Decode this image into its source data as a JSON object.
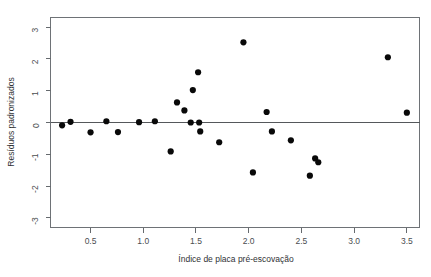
{
  "figure": {
    "top_cropped_text": "",
    "background_color": "#ffffff",
    "point_color": "#090909",
    "axis_color": "#666a6e",
    "frame_color": "#6e7276"
  },
  "chart_data": {
    "type": "scatter",
    "title": "",
    "xlabel": "Índice de placa pré-escovação",
    "ylabel": "Resíduos padronizados",
    "xlim": [
      0.12,
      3.62
    ],
    "ylim": [
      -3.3,
      3.3
    ],
    "grid": false,
    "legend": null,
    "reference_lines": [
      {
        "axis": "y",
        "value": 0,
        "style": "solid"
      }
    ],
    "xticks": [
      0.5,
      1.0,
      1.5,
      2.0,
      2.5,
      3.0,
      3.5
    ],
    "xtick_labels": [
      "0.5",
      "1.0",
      "1.5",
      "2.0",
      "2.5",
      "3.0",
      "3.5"
    ],
    "yticks": [
      -3,
      -2,
      -1,
      0,
      1,
      2,
      3
    ],
    "ytick_labels": [
      "-3",
      "-2",
      "-1",
      "0",
      "1",
      "2",
      "3"
    ],
    "points": [
      {
        "x": 0.23,
        "y": -0.09
      },
      {
        "x": 0.31,
        "y": 0.02
      },
      {
        "x": 0.5,
        "y": -0.31
      },
      {
        "x": 0.65,
        "y": 0.04
      },
      {
        "x": 0.76,
        "y": -0.3
      },
      {
        "x": 0.96,
        "y": 0.01
      },
      {
        "x": 1.11,
        "y": 0.04
      },
      {
        "x": 1.32,
        "y": 0.63
      },
      {
        "x": 1.26,
        "y": -0.91
      },
      {
        "x": 1.39,
        "y": 0.38
      },
      {
        "x": 1.47,
        "y": 1.02
      },
      {
        "x": 1.52,
        "y": 1.58
      },
      {
        "x": 1.45,
        "y": 0.0
      },
      {
        "x": 1.53,
        "y": 0.0
      },
      {
        "x": 1.54,
        "y": -0.28
      },
      {
        "x": 1.95,
        "y": 2.52
      },
      {
        "x": 1.72,
        "y": -0.62
      },
      {
        "x": 2.04,
        "y": -1.57
      },
      {
        "x": 2.17,
        "y": 0.33
      },
      {
        "x": 2.22,
        "y": -0.28
      },
      {
        "x": 2.4,
        "y": -0.56
      },
      {
        "x": 2.58,
        "y": -1.67
      },
      {
        "x": 2.63,
        "y": -1.13
      },
      {
        "x": 2.66,
        "y": -1.25
      },
      {
        "x": 3.32,
        "y": 2.05
      },
      {
        "x": 3.5,
        "y": 0.31
      }
    ]
  }
}
